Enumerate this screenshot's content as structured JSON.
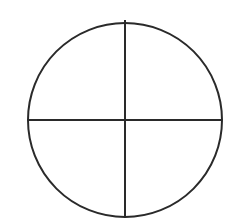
{
  "diagram": {
    "type": "quartered-circle",
    "background": "#ffffff",
    "stroke_color": "#2a2a2a",
    "stroke_width": 2,
    "circle": {
      "cx": 125,
      "cy": 120,
      "r": 97
    },
    "lines": [
      {
        "name": "vertical-divider",
        "x1": 125,
        "y1": 20,
        "x2": 125,
        "y2": 218
      },
      {
        "name": "horizontal-divider",
        "x1": 28,
        "y1": 120,
        "x2": 222,
        "y2": 120
      }
    ]
  }
}
